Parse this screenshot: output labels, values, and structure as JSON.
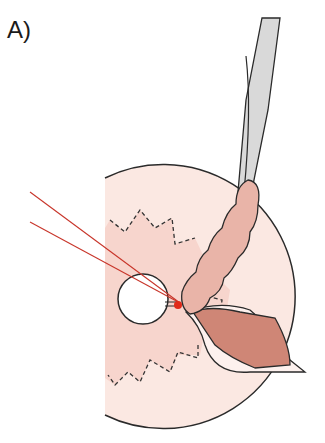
{
  "figure": {
    "panel_label": "A)",
    "colors": {
      "disc_fill": "#fbe6e0",
      "disc_inner_fill": "#f7d3cb",
      "tissue_fill": "#e9b3a6",
      "muscle_fill": "#cf8676",
      "instrument_fill": "#d9d9d9",
      "laser_lines": "#c8352a",
      "focus_point": "#e02a1a",
      "outline": "#2a2a2a"
    }
  }
}
